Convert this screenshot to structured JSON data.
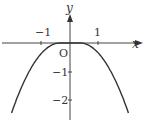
{
  "diagram": {
    "type": "function-graph",
    "axes": {
      "x_label": "x",
      "y_label": "y",
      "origin_label": "O",
      "x_ticks": [
        {
          "value": -1,
          "label": "−1"
        },
        {
          "value": 1,
          "label": "1"
        }
      ],
      "y_ticks": [
        {
          "value": -1,
          "label": "−1"
        },
        {
          "value": -2,
          "label": "−2"
        }
      ]
    },
    "curve": {
      "description": "downward curve, flat near origin (y = 0 for |x| small), symmetric about y-axis",
      "x_range": [
        -2.05,
        2.05
      ],
      "color": "#333333"
    }
  }
}
